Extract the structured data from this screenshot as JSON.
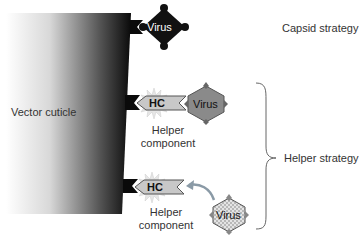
{
  "labels": {
    "vector_cuticle": "Vector cuticle",
    "capsid_strategy": "Capsid strategy",
    "helper_strategy": "Helper strategy",
    "virus": "Virus",
    "hc": "HC",
    "helper_component_line1": "Helper",
    "helper_component_line2": "component"
  },
  "groups": [
    {
      "strategy": "Capsid strategy",
      "virus_style": "black diamond",
      "has_helper_component": false
    },
    {
      "strategy": "Helper strategy",
      "virus_style": "grey hexagon",
      "has_helper_component": true,
      "state": "bound"
    },
    {
      "strategy": "Helper strategy",
      "virus_style": "checkered hexagon",
      "has_helper_component": true,
      "state": "approaching"
    }
  ],
  "colors": {
    "cuticle_dark": "#111111",
    "cuticle_light": "#ffffff",
    "virus_capsid": "#111111",
    "virus_helper": "#8a8a8a",
    "virus_free": "#d9d9d9",
    "hc_fill": "#c8c8c8",
    "arrow": "#8a9aa6",
    "text": "#333333"
  }
}
